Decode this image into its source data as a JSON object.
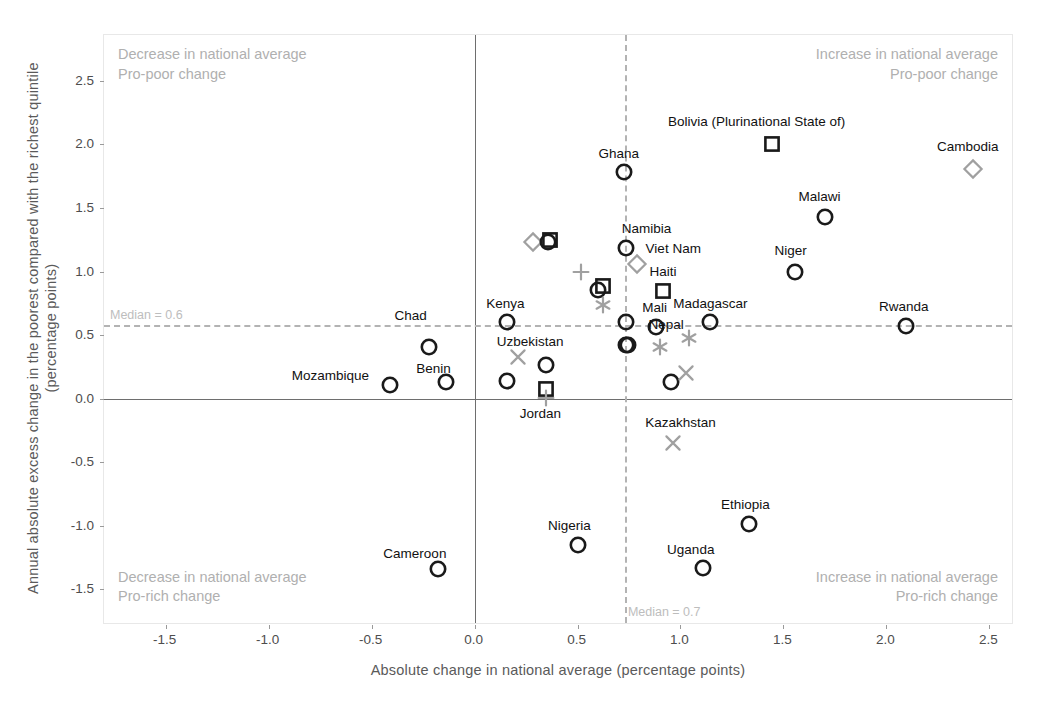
{
  "chart_data": {
    "type": "scatter",
    "title": "",
    "xlabel": "Absolute change in national average (percentage points)",
    "ylabel": "Annual absolute excess change in the poorest compared with the richest quintile (percentage points)",
    "xlim": [
      -1.8,
      2.62
    ],
    "ylim": [
      -1.78,
      2.86
    ],
    "xticks": [
      -1.5,
      -1.0,
      -0.5,
      0.0,
      0.5,
      1.0,
      1.5,
      2.0,
      2.5
    ],
    "xticklabels": [
      "-1.5",
      "-1.0",
      "-0.5",
      "0.0",
      "0.5",
      "1.0",
      "1.5",
      "2.0",
      "2.5"
    ],
    "yticks": [
      -1.5,
      -1.0,
      -0.5,
      0.0,
      0.5,
      1.0,
      1.5,
      2.0,
      2.5
    ],
    "yticklabels": [
      "-1.5",
      "-1.0",
      "-0.5",
      "0.0",
      "0.5",
      "1.0",
      "1.5",
      "2.0",
      "2.5"
    ],
    "grid": false,
    "legend": "none",
    "reference_lines": {
      "x_zero": 0.0,
      "y_zero": 0.0,
      "x_median": 0.73,
      "y_median": 0.58,
      "x_median_label": "Median = 0.7",
      "y_median_label": "Median = 0.6"
    },
    "quadrant_annotations": [
      {
        "id": "top-left",
        "line1": "Decrease in national average",
        "line2": "Pro-poor change"
      },
      {
        "id": "top-right",
        "line1": "Increase in national average",
        "line2": "Pro-poor change"
      },
      {
        "id": "bottom-left",
        "line1": "Decrease in national average",
        "line2": "Pro-rich change"
      },
      {
        "id": "bottom-right",
        "line1": "Increase in national average",
        "line2": "Pro-rich change"
      }
    ],
    "marker_colors": {
      "dark": "#1a1a1a",
      "light": "#a0a0a0"
    },
    "points": [
      {
        "label": "Mozambique",
        "x": -0.41,
        "y": 0.11,
        "marker": "circle",
        "color": "dark",
        "lx": -0.7,
        "ly": 0.19,
        "anchor": "end"
      },
      {
        "label": "Benin",
        "x": -0.14,
        "y": 0.13,
        "marker": "circle",
        "color": "dark",
        "lx": -0.2,
        "ly": 0.245,
        "anchor": "middle"
      },
      {
        "label": "Chad",
        "x": -0.22,
        "y": 0.41,
        "marker": "circle",
        "color": "dark",
        "lx": -0.31,
        "ly": 0.655,
        "anchor": "middle"
      },
      {
        "label": "Cameroon",
        "x": -0.18,
        "y": -1.34,
        "marker": "circle",
        "color": "dark",
        "lx": -0.29,
        "ly": -1.21,
        "anchor": "middle"
      },
      {
        "label": "Kenya",
        "x": 0.155,
        "y": 0.6,
        "marker": "circle",
        "color": "dark",
        "lx": 0.15,
        "ly": 0.755,
        "anchor": "middle"
      },
      {
        "label": "",
        "x": 0.155,
        "y": 0.135,
        "marker": "circle",
        "color": "dark",
        "lx": null,
        "ly": null,
        "anchor": "middle"
      },
      {
        "label": "Uzbekistan",
        "x": 0.21,
        "y": 0.325,
        "marker": "x",
        "color": "light",
        "lx": 0.27,
        "ly": 0.455,
        "anchor": "middle"
      },
      {
        "label": "",
        "x": 0.285,
        "y": 1.235,
        "marker": "diamond",
        "color": "light",
        "lx": null,
        "ly": null,
        "anchor": "middle"
      },
      {
        "label": "",
        "x": 0.355,
        "y": 1.235,
        "marker": "circle",
        "color": "dark",
        "lx": null,
        "ly": null,
        "anchor": "middle"
      },
      {
        "label": "",
        "x": 0.365,
        "y": 1.245,
        "marker": "square",
        "color": "dark",
        "lx": null,
        "ly": null,
        "anchor": "middle"
      },
      {
        "label": "",
        "x": 0.345,
        "y": 0.265,
        "marker": "circle",
        "color": "dark",
        "lx": null,
        "ly": null,
        "anchor": "middle"
      },
      {
        "label": "Jordan",
        "x": 0.345,
        "y": 0.075,
        "marker": "square",
        "color": "dark",
        "lx": 0.32,
        "ly": -0.115,
        "anchor": "middle"
      },
      {
        "label": "",
        "x": 0.345,
        "y": 0.005,
        "marker": "plus",
        "color": "light",
        "lx": null,
        "ly": null,
        "anchor": "middle"
      },
      {
        "label": "Nigeria",
        "x": 0.5,
        "y": -1.15,
        "marker": "circle",
        "color": "dark",
        "lx": 0.46,
        "ly": -0.99,
        "anchor": "middle"
      },
      {
        "label": "",
        "x": 0.515,
        "y": 1.0,
        "marker": "plus",
        "color": "light",
        "lx": null,
        "ly": null,
        "anchor": "middle"
      },
      {
        "label": "",
        "x": 0.6,
        "y": 0.855,
        "marker": "circle",
        "color": "dark",
        "lx": null,
        "ly": null,
        "anchor": "middle"
      },
      {
        "label": "",
        "x": 0.625,
        "y": 0.885,
        "marker": "square",
        "color": "dark",
        "lx": null,
        "ly": null,
        "anchor": "middle"
      },
      {
        "label": "",
        "x": 0.625,
        "y": 0.735,
        "marker": "asterisk",
        "color": "light",
        "lx": null,
        "ly": null,
        "anchor": "middle"
      },
      {
        "label": "Ghana",
        "x": 0.725,
        "y": 1.78,
        "marker": "circle",
        "color": "dark",
        "lx": 0.7,
        "ly": 1.935,
        "anchor": "middle"
      },
      {
        "label": "Namibia",
        "x": 0.735,
        "y": 1.185,
        "marker": "circle",
        "color": "dark",
        "lx": 0.835,
        "ly": 1.34,
        "anchor": "middle"
      },
      {
        "label": "Viet Nam",
        "x": 0.79,
        "y": 1.06,
        "marker": "diamond",
        "color": "light",
        "lx": 0.965,
        "ly": 1.185,
        "anchor": "middle"
      },
      {
        "label": "",
        "x": 0.735,
        "y": 0.605,
        "marker": "circle",
        "color": "dark",
        "lx": null,
        "ly": null,
        "anchor": "middle"
      },
      {
        "label": "",
        "x": 0.735,
        "y": 0.425,
        "marker": "circle",
        "color": "dark",
        "lx": null,
        "ly": null,
        "anchor": "middle"
      },
      {
        "label": "",
        "x": 0.745,
        "y": 0.425,
        "marker": "circle",
        "color": "dark",
        "lx": null,
        "ly": null,
        "anchor": "middle"
      },
      {
        "label": "Haiti",
        "x": 0.915,
        "y": 0.845,
        "marker": "square",
        "color": "dark",
        "lx": 0.915,
        "ly": 1.005,
        "anchor": "middle"
      },
      {
        "label": "Mali",
        "x": 0.88,
        "y": 0.565,
        "marker": "circle",
        "color": "dark",
        "lx": 0.875,
        "ly": 0.72,
        "anchor": "middle"
      },
      {
        "label": "",
        "x": 0.9,
        "y": 0.41,
        "marker": "asterisk",
        "color": "light",
        "lx": null,
        "ly": null,
        "anchor": "middle"
      },
      {
        "label": "",
        "x": 0.955,
        "y": 0.13,
        "marker": "circle",
        "color": "dark",
        "lx": null,
        "ly": null,
        "anchor": "middle"
      },
      {
        "label": "",
        "x": 1.025,
        "y": 0.205,
        "marker": "x",
        "color": "light",
        "lx": null,
        "ly": null,
        "anchor": "middle"
      },
      {
        "label": "Kazakhstan",
        "x": 0.965,
        "y": -0.345,
        "marker": "x",
        "color": "light",
        "lx": 1.0,
        "ly": -0.185,
        "anchor": "middle"
      },
      {
        "label": "Nepal",
        "x": 1.04,
        "y": 0.475,
        "marker": "asterisk",
        "color": "light",
        "lx": 0.93,
        "ly": 0.585,
        "anchor": "middle"
      },
      {
        "label": "Madagascar",
        "x": 1.145,
        "y": 0.6,
        "marker": "circle",
        "color": "dark",
        "lx": 1.145,
        "ly": 0.755,
        "anchor": "middle"
      },
      {
        "label": "Uganda",
        "x": 1.11,
        "y": -1.335,
        "marker": "circle",
        "color": "dark",
        "lx": 1.05,
        "ly": -1.185,
        "anchor": "middle"
      },
      {
        "label": "Ethiopia",
        "x": 1.335,
        "y": -0.985,
        "marker": "circle",
        "color": "dark",
        "lx": 1.315,
        "ly": -0.83,
        "anchor": "middle"
      },
      {
        "label": "Bolivia (Plurinational State of)",
        "x": 1.445,
        "y": 2.0,
        "marker": "square",
        "color": "dark",
        "lx": 1.37,
        "ly": 2.18,
        "anchor": "middle"
      },
      {
        "label": "Niger",
        "x": 1.555,
        "y": 1.0,
        "marker": "circle",
        "color": "dark",
        "lx": 1.535,
        "ly": 1.17,
        "anchor": "middle"
      },
      {
        "label": "Malawi",
        "x": 1.7,
        "y": 1.425,
        "marker": "circle",
        "color": "dark",
        "lx": 1.675,
        "ly": 1.59,
        "anchor": "middle"
      },
      {
        "label": "Rwanda",
        "x": 2.095,
        "y": 0.57,
        "marker": "circle",
        "color": "dark",
        "lx": 2.085,
        "ly": 0.725,
        "anchor": "middle"
      },
      {
        "label": "Cambodia",
        "x": 2.42,
        "y": 1.81,
        "marker": "diamond",
        "color": "light",
        "lx": 2.395,
        "ly": 1.99,
        "anchor": "middle"
      }
    ]
  }
}
